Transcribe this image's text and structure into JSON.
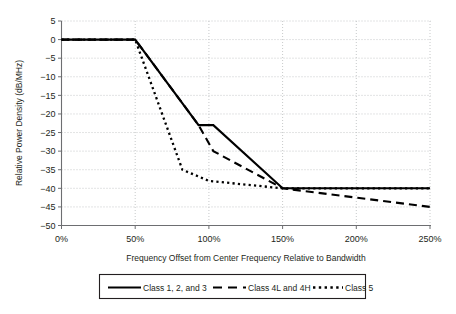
{
  "chart_data": {
    "type": "line",
    "title": "",
    "xlabel": "Frequency Offset from Center Frequency Relative to Bandwidth",
    "ylabel": "Relative Power Density (dB/MHz)",
    "xlim": [
      0,
      250
    ],
    "ylim": [
      -50,
      5
    ],
    "xtick_labels": [
      "0%",
      "50%",
      "100%",
      "150%",
      "200%",
      "250%"
    ],
    "xticks": [
      0,
      50,
      100,
      150,
      200,
      250
    ],
    "ytick_labels": [
      "5",
      "0",
      "−5",
      "−10",
      "−15",
      "−20",
      "−25",
      "−30",
      "−35",
      "−40",
      "−45",
      "−50"
    ],
    "yticks": [
      5,
      0,
      -5,
      -10,
      -15,
      -20,
      -25,
      -30,
      -35,
      -40,
      -45,
      -50
    ],
    "grid": true,
    "legend_position": "bottom",
    "series": [
      {
        "name": "Class 1, 2, and 3",
        "style": "solid",
        "points": [
          [
            0,
            0
          ],
          [
            50,
            0
          ],
          [
            93,
            -23
          ],
          [
            103,
            -23
          ],
          [
            150,
            -40
          ],
          [
            250,
            -40
          ]
        ]
      },
      {
        "name": "Class 4L and 4H",
        "style": "dashed",
        "points": [
          [
            0,
            0
          ],
          [
            50,
            0
          ],
          [
            93,
            -23
          ],
          [
            103,
            -30
          ],
          [
            150,
            -40
          ],
          [
            250,
            -45
          ]
        ]
      },
      {
        "name": "Class 5",
        "style": "dotted",
        "points": [
          [
            0,
            0
          ],
          [
            50,
            0
          ],
          [
            82,
            -35
          ],
          [
            100,
            -38
          ],
          [
            150,
            -40
          ],
          [
            250,
            -40
          ]
        ]
      }
    ]
  },
  "legend": {
    "entries": [
      {
        "label": "Class 1, 2, and 3",
        "style": "solid"
      },
      {
        "label": "Class 4L and 4H",
        "style": "dashed"
      },
      {
        "label": "Class 5",
        "style": "dotted"
      }
    ]
  },
  "axes": {
    "x_title": "Frequency Offset from Center Frequency Relative to Bandwidth",
    "y_title": "Relative Power Density (dB/MHz)"
  },
  "colors": {
    "series": "#000000",
    "axis": "#6d6e71",
    "grid": "#b9bbbd",
    "text": "#231f20",
    "background": "#ffffff"
  }
}
